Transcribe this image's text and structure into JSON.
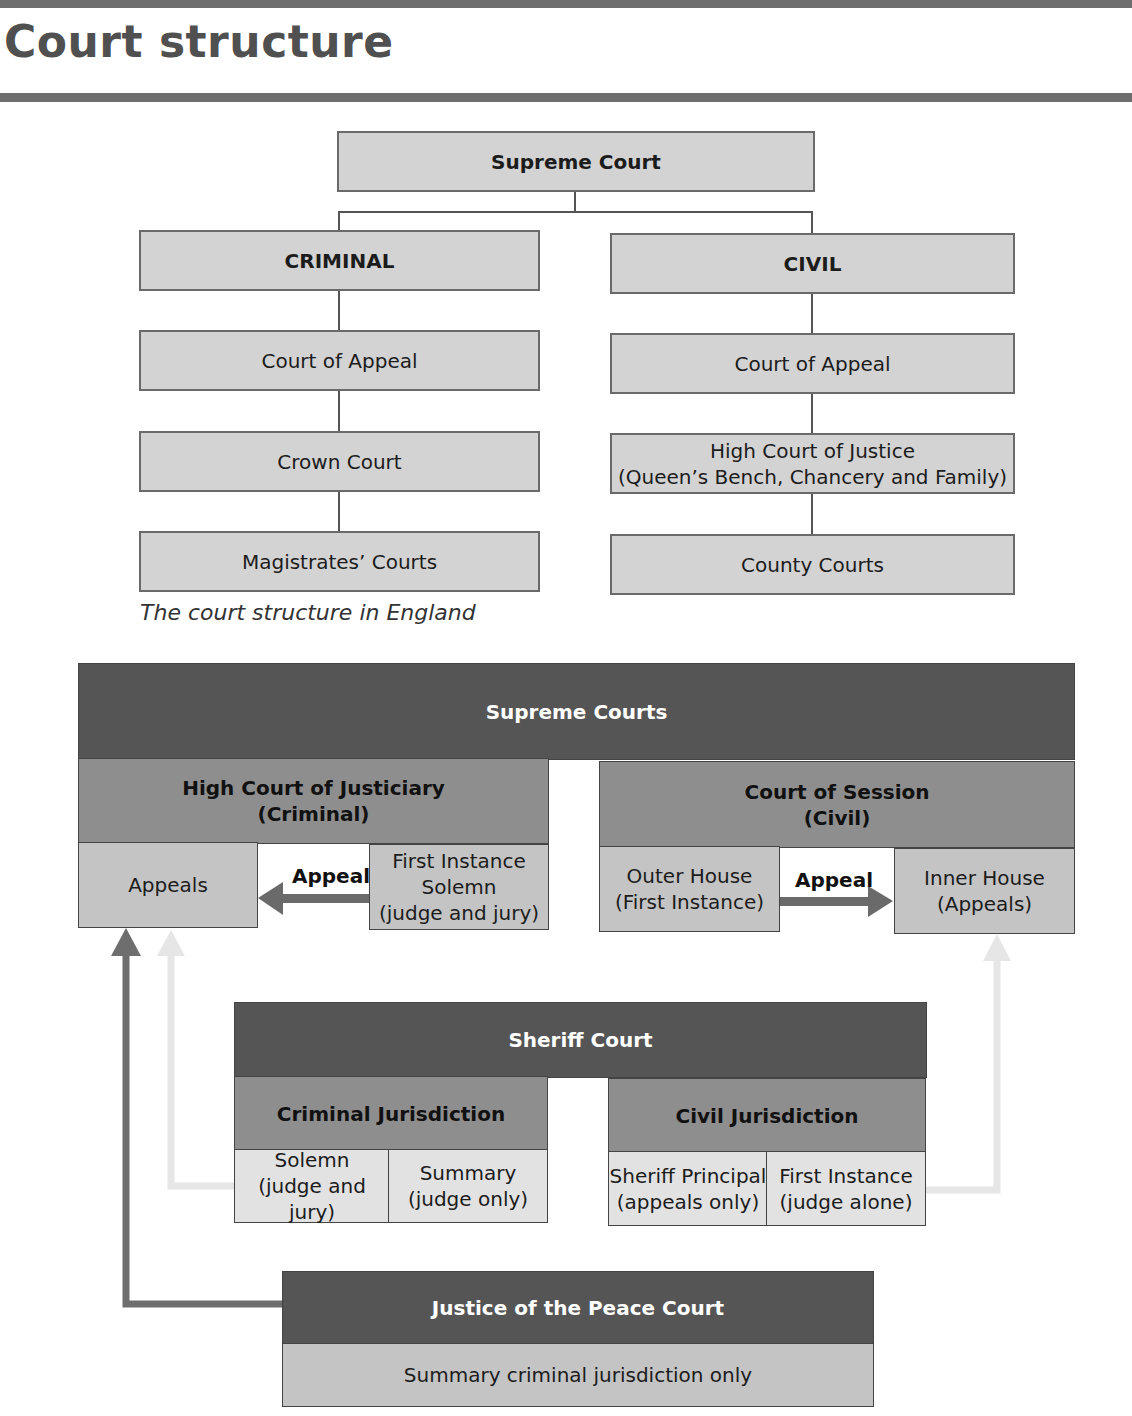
{
  "page": {
    "title": "Court structure"
  },
  "england": {
    "top": "Supreme Court",
    "criminal": {
      "header": "CRIMINAL",
      "levels": [
        "Court of Appeal",
        "Crown Court",
        "Magistrates’ Courts"
      ]
    },
    "civil": {
      "header": "CIVIL",
      "levels": [
        "Court of Appeal",
        "High Court of Justice\n(Queen’s Bench, Chancery and Family)",
        "County Courts"
      ]
    },
    "caption": "The court structure in England"
  },
  "scotland": {
    "supreme": "Supreme Courts",
    "justiciary": {
      "header_line1": "High Court of Justiciary",
      "header_line2": "(Criminal)",
      "appeals": "Appeals",
      "appeal_label": "Appeal",
      "first_instance_line1": "First Instance",
      "first_instance_line2": "Solemn",
      "first_instance_line3": "(judge and jury)"
    },
    "session": {
      "header_line1": "Court of Session",
      "header_line2": "(Civil)",
      "outer_line1": "Outer House",
      "outer_line2": "(First Instance)",
      "appeal_label": "Appeal",
      "inner_line1": "Inner House",
      "inner_line2": "(Appeals)"
    },
    "sheriff": {
      "header": "Sheriff Court",
      "criminal": {
        "header": "Criminal Jurisdiction",
        "solemn_line1": "Solemn",
        "solemn_line2": "(judge and jury)",
        "summary_line1": "Summary",
        "summary_line2": "(judge only)"
      },
      "civil": {
        "header": "Civil Jurisdiction",
        "principal_line1": "Sheriff Principal",
        "principal_line2": "(appeals only)",
        "first_line1": "First Instance",
        "first_line2": "(judge alone)"
      }
    },
    "jp": {
      "header": "Justice of the Peace Court",
      "body": "Summary criminal jurisdiction only"
    }
  },
  "colors": {
    "dark": "#555555",
    "mid": "#8e8e8e",
    "light": "#c4c4c4",
    "pale": "#e2e2e2",
    "arrow_dark": "#6a6a6a",
    "arrow_pale": "#e6e6e6"
  }
}
